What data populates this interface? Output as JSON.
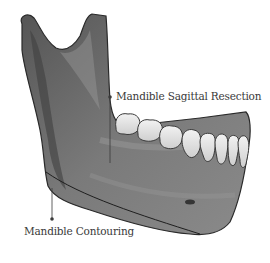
{
  "diagram": {
    "labels": [
      {
        "id": "sagittal",
        "text": "Mandible Sagittal Resection"
      },
      {
        "id": "contouring",
        "text": "Mandible Contouring"
      }
    ],
    "colors": {
      "bone_dark": "#4a4a4a",
      "bone_mid": "#6e6e6e",
      "bone_light": "#9a9a9a",
      "teeth": "#e2e2e2",
      "outline": "#2a2a2a",
      "leader": "#3a3a3a"
    },
    "teeth_count": 8
  }
}
